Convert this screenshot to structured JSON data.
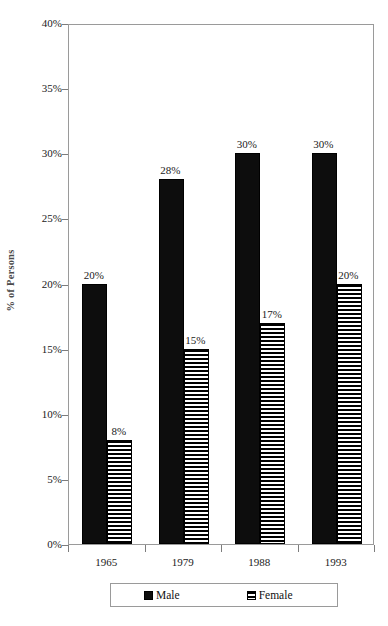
{
  "figure": {
    "title_remnant": "",
    "y_axis_title": "% of Persons",
    "legend_position": "below-axis"
  },
  "chart_data": {
    "type": "bar",
    "title": "",
    "subtitle": "",
    "xlabel": "",
    "ylabel": "% of Persons",
    "categories": [
      "1965",
      "1979",
      "1988",
      "1993"
    ],
    "series": [
      {
        "name": "Male",
        "color": "#0d0d0d",
        "fill": "solid-black",
        "values": [
          20,
          28,
          30,
          30
        ],
        "labels": [
          "20%",
          "28%",
          "30%",
          "30%"
        ]
      },
      {
        "name": "Female",
        "color": "#000000",
        "fill": "horizontal-stripes",
        "values": [
          8,
          15,
          17,
          20
        ],
        "labels": [
          "8%",
          "15%",
          "17%",
          "20%"
        ]
      }
    ],
    "ylim": [
      0,
      40
    ],
    "ytick_values": [
      0,
      5,
      10,
      15,
      20,
      25,
      30,
      35,
      40
    ],
    "ytick_labels": [
      "0%",
      "5%",
      "10%",
      "15%",
      "20%",
      "25%",
      "30%",
      "35%",
      "40%"
    ],
    "grid": false,
    "value_unit": "percent",
    "legend_entries": [
      "Male",
      "Female"
    ]
  }
}
